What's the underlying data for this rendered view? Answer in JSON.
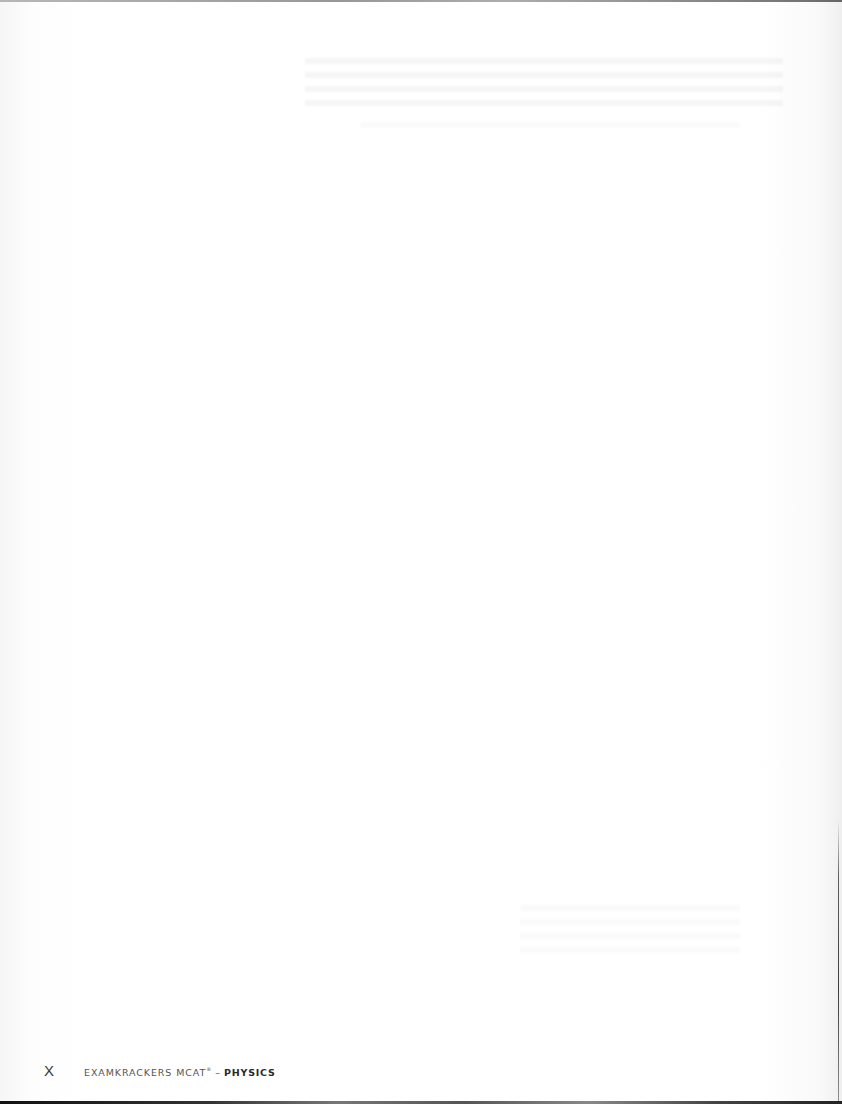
{
  "page": {
    "background": "#ffffff",
    "content": ""
  },
  "footer": {
    "page_number": "X",
    "running_title": "EXAMKRACKERS MCAT",
    "registered_mark": "®",
    "separator": "–",
    "subject": "PHYSICS"
  }
}
